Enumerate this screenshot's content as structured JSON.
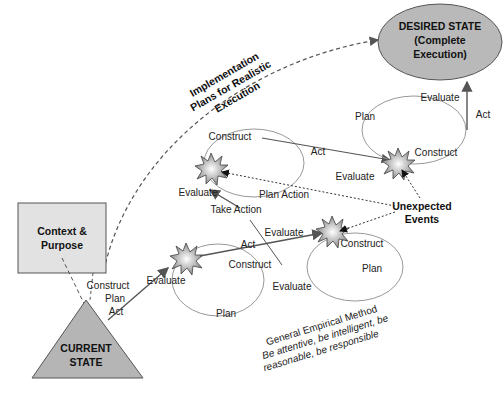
{
  "nodes": {
    "desired_state": {
      "line1": "DESIRED STATE",
      "line2": "(Complete",
      "line3": "Execution)"
    },
    "current_state": {
      "line1": "CURRENT",
      "line2": "STATE"
    },
    "context": {
      "line1": "Context &",
      "line2": "Purpose"
    }
  },
  "implementation_label": {
    "line1": "Implementation",
    "line2": "Plans for Realistic",
    "line3": "Execution"
  },
  "start_labels": {
    "construct": "Construct",
    "plan": "Plan",
    "act": "Act"
  },
  "cycle1": {
    "evaluate": "Evaluate",
    "construct": "Construct",
    "plan": "Plan",
    "act": "Act"
  },
  "cycle2": {
    "evaluate_in": "Evaluate",
    "construct": "Construct",
    "plan": "Plan",
    "evaluate": "Evaluate"
  },
  "cycle3": {
    "construct": "Construct",
    "act": "Act",
    "plan_action": "Plan Action",
    "evaluate": "Evaluate",
    "take_action": "Take Action"
  },
  "cycle4": {
    "evaluate": "Evaluate",
    "construct": "Construct",
    "plan": "Plan",
    "evaluate_top": "Evaluate",
    "act": "Act"
  },
  "unexpected": {
    "line1": "Unexpected",
    "line2": "Events"
  },
  "method": {
    "line1": "General Empirical Method",
    "line2": "Be attentive, be intelligent, be",
    "line3": "reasonable, be responsible"
  },
  "colors": {
    "shape_fill": "#c8c8c8",
    "box_fill": "#e2e2e2",
    "stroke": "#555555",
    "loop": "#999999"
  }
}
